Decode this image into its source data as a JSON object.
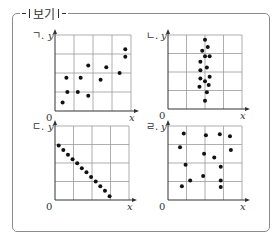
{
  "header": {
    "title": "보기"
  },
  "axis_labels": {
    "x": "x",
    "y": "y",
    "origin": "0"
  },
  "colors": {
    "grid": "#9a9a9a",
    "axis": "#333333",
    "point": "#111111",
    "frame": "#8c8c8c"
  },
  "chart_data": [
    {
      "type": "scatter",
      "label": "ㄱ.",
      "title": "ㄱ. positive correlation",
      "xlabel": "x",
      "ylabel": "y",
      "grid": true,
      "grid_cells": [
        4,
        4
      ],
      "xlim": [
        0,
        4
      ],
      "ylim": [
        0,
        4
      ],
      "points": [
        [
          0.4,
          0.45
        ],
        [
          0.65,
          1.0
        ],
        [
          1.2,
          1.0
        ],
        [
          1.75,
          0.8
        ],
        [
          0.6,
          1.75
        ],
        [
          1.35,
          1.75
        ],
        [
          1.75,
          2.4
        ],
        [
          2.4,
          1.65
        ],
        [
          2.7,
          2.3
        ],
        [
          3.4,
          2.0
        ],
        [
          3.7,
          2.85
        ],
        [
          3.7,
          3.25
        ]
      ]
    },
    {
      "type": "scatter",
      "label": "ㄴ.",
      "title": "ㄴ. x constant, no correlation",
      "xlabel": "x",
      "ylabel": "y",
      "grid": true,
      "grid_cells": [
        4,
        4
      ],
      "xlim": [
        0,
        4
      ],
      "ylim": [
        0,
        4
      ],
      "points": [
        [
          2.0,
          3.75
        ],
        [
          2.15,
          3.35
        ],
        [
          1.85,
          3.15
        ],
        [
          2.0,
          2.85
        ],
        [
          2.25,
          2.85
        ],
        [
          1.75,
          2.55
        ],
        [
          2.1,
          2.25
        ],
        [
          1.75,
          2.1
        ],
        [
          2.25,
          1.75
        ],
        [
          1.75,
          1.65
        ],
        [
          2.0,
          1.5
        ],
        [
          2.2,
          1.3
        ],
        [
          1.7,
          1.2
        ],
        [
          2.1,
          0.9
        ],
        [
          2.0,
          0.45
        ]
      ]
    },
    {
      "type": "scatter",
      "label": "ㄷ.",
      "title": "ㄷ. perfect negative linear relation",
      "xlabel": "x",
      "ylabel": "y",
      "grid": true,
      "grid_cells": [
        4,
        4
      ],
      "xlim": [
        0,
        4
      ],
      "ylim": [
        0,
        4
      ],
      "points": [
        [
          0.2,
          2.95
        ],
        [
          0.45,
          2.7
        ],
        [
          0.7,
          2.45
        ],
        [
          0.95,
          2.2
        ],
        [
          1.2,
          1.98
        ],
        [
          1.45,
          1.72
        ],
        [
          1.7,
          1.5
        ],
        [
          1.95,
          1.25
        ],
        [
          2.2,
          1.0
        ],
        [
          2.45,
          0.75
        ],
        [
          2.7,
          0.5
        ],
        [
          2.95,
          0.2
        ]
      ]
    },
    {
      "type": "scatter",
      "label": "ㄹ.",
      "title": "ㄹ. scattered, no correlation",
      "xlabel": "x",
      "ylabel": "y",
      "grid": true,
      "grid_cells": [
        4,
        4
      ],
      "xlim": [
        0,
        4
      ],
      "ylim": [
        0,
        4
      ],
      "points": [
        [
          0.85,
          3.6
        ],
        [
          2.05,
          3.5
        ],
        [
          2.8,
          3.55
        ],
        [
          3.35,
          3.45
        ],
        [
          0.65,
          2.85
        ],
        [
          1.95,
          2.5
        ],
        [
          2.5,
          2.3
        ],
        [
          3.4,
          2.7
        ],
        [
          0.95,
          1.9
        ],
        [
          2.85,
          1.8
        ],
        [
          1.9,
          1.3
        ],
        [
          2.85,
          1.05
        ],
        [
          1.2,
          1.05
        ],
        [
          0.75,
          0.75
        ],
        [
          2.85,
          0.7
        ]
      ]
    }
  ]
}
